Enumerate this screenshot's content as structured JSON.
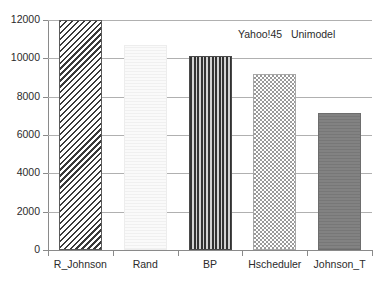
{
  "chart_data": {
    "type": "bar",
    "title": "Yahoo!45   Unimodel",
    "xlabel": "",
    "ylabel": "",
    "categories": [
      "R_Johnson",
      "Rand",
      "BP",
      "Hscheduler",
      "Johnson_T"
    ],
    "values": [
      12000,
      10700,
      10100,
      9200,
      7150
    ],
    "series": [
      {
        "name": "Unimodel",
        "values": [
          12000,
          10700,
          10100,
          9200,
          7150
        ]
      }
    ],
    "ylim": [
      0,
      12000
    ],
    "yticks": [
      0,
      2000,
      4000,
      6000,
      8000,
      10000,
      12000
    ],
    "ytick_labels": [
      "0",
      "2000",
      "4000",
      "6000",
      "8000",
      "10000",
      "12000"
    ],
    "grid": true,
    "grid_axis": "y",
    "legend": false,
    "bar_fills": [
      "diagonal-hatch",
      "very-light-solid",
      "vertical-stripes",
      "checkerboard",
      "solid-gray"
    ],
    "colors": {
      "axis": "#8a8a8a",
      "grid": "#b0b0b0",
      "text": "#2b2b2b",
      "background": "#ffffff",
      "bar_hatch": "#3a3a3a",
      "bar_light": "#f4f4f4",
      "bar_stripe": "#323232",
      "bar_checker": "#9a9a9a",
      "bar_solid": "#7d7d7d"
    }
  }
}
